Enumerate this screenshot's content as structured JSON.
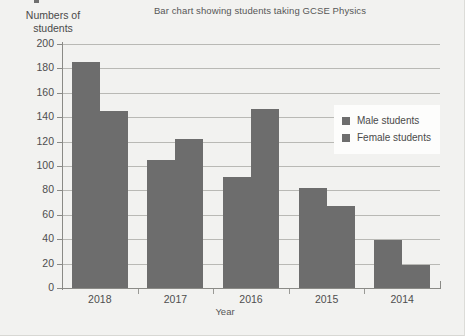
{
  "figure": {
    "y_axis_title": "Numbers of\nstudents",
    "y_axis_title_line1": "Numbers of",
    "y_axis_title_line2": "students",
    "x_axis_title": "Year",
    "bar_color": "#6d6d6d",
    "gridline_color": "#b9b9b5",
    "background_color": "#f2f2f0"
  },
  "legend": {
    "position": "inside-right",
    "entries": [
      {
        "label": "Male students",
        "color": "#6d6d6d"
      },
      {
        "label": "Female students",
        "color": "#6d6d6d"
      }
    ]
  },
  "chart_data": {
    "type": "bar",
    "title": "Bar chart showing students taking GCSE Physics",
    "xlabel": "Year",
    "ylabel": "Numbers of students",
    "categories": [
      "2018",
      "2017",
      "2016",
      "2015",
      "2014"
    ],
    "series": [
      {
        "name": "Male students",
        "values": [
          185,
          105,
          91,
          82,
          39
        ]
      },
      {
        "name": "Female students",
        "values": [
          145,
          122,
          147,
          67,
          19
        ]
      }
    ],
    "ylim": [
      0,
      200
    ],
    "ytick_step": 20,
    "ytick_labels": [
      "200",
      "180",
      "160",
      "140",
      "120",
      "100",
      "80",
      "60",
      "40",
      "20",
      "0"
    ],
    "grid": true,
    "grid_axis": "y",
    "legend_position": "inside-right"
  }
}
